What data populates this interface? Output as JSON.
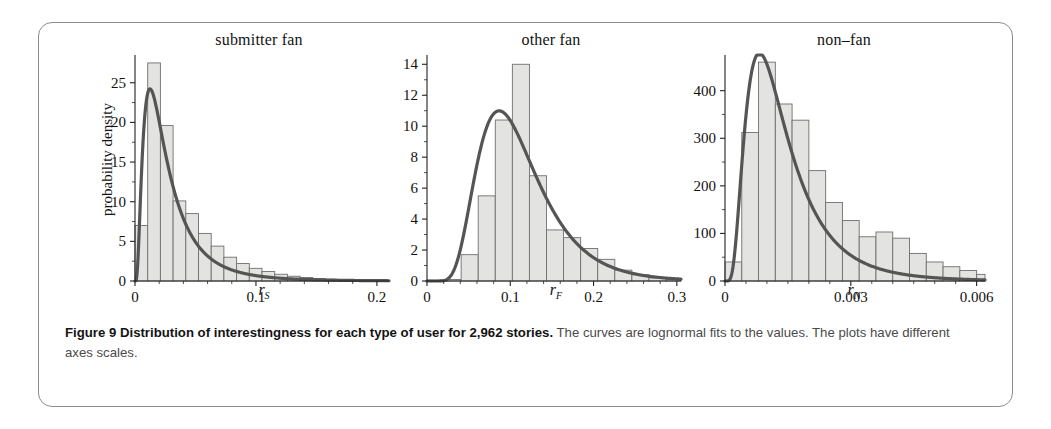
{
  "figure": {
    "caption_bold": "Figure 9  Distribution of interestingness for each type of user for 2,962 stories.",
    "caption_rest": " The curves are lognormal fits to the values. The plots have different axes scales.",
    "border_color": "#8c8c8c",
    "bar_fill": "#e3e3e1",
    "bar_stroke": "#6f6f6f",
    "curve_color": "#555555",
    "axis_color": "#222222"
  },
  "chart_data": [
    {
      "type": "bar",
      "title": "submitter fan",
      "xlabel": "rS",
      "xlabel_base": "r",
      "xlabel_sub": "S",
      "ylabel": "probability density",
      "xlim": [
        0,
        0.21
      ],
      "ylim": [
        0,
        28.5
      ],
      "xticks": [
        0,
        0.1,
        0.2
      ],
      "xticklabels": [
        "0",
        "0.1",
        "0.2"
      ],
      "xminorticks": [
        0.02,
        0.04,
        0.06,
        0.08,
        0.12,
        0.14,
        0.16,
        0.18
      ],
      "yticks": [
        0,
        5,
        10,
        15,
        20,
        25
      ],
      "yticklabels": [
        "0",
        "5",
        "10",
        "15",
        "20",
        "25"
      ],
      "bin_width": 0.0105,
      "bin_start": 0.0,
      "values": [
        7.0,
        27.5,
        19.6,
        10.1,
        8.5,
        6.0,
        4.4,
        3.0,
        2.2,
        1.6,
        1.2,
        0.85,
        0.6,
        0.45,
        0.32,
        0.22,
        0.16,
        0.12,
        0.08,
        0.05
      ],
      "fit": {
        "kind": "lognormal",
        "mu": -3.78,
        "sigma": 0.78,
        "peak_y": 22.0,
        "peak_x": 0.0175
      },
      "grid": false,
      "legend": "none"
    },
    {
      "type": "bar",
      "title": "other fan",
      "xlabel": "rF",
      "xlabel_base": "r",
      "xlabel_sub": "F",
      "ylabel": "",
      "xlim": [
        0,
        0.305
      ],
      "ylim": [
        0,
        14.6
      ],
      "xticks": [
        0,
        0.1,
        0.2,
        0.3
      ],
      "xticklabels": [
        "0",
        "0.1",
        "0.2",
        "0.3"
      ],
      "xminorticks": [
        0.02,
        0.04,
        0.06,
        0.08,
        0.12,
        0.14,
        0.16,
        0.18,
        0.22,
        0.24,
        0.26,
        0.28
      ],
      "yticks": [
        0,
        2,
        4,
        6,
        8,
        10,
        12,
        14
      ],
      "yticklabels": [
        "0",
        "2",
        "4",
        "6",
        "8",
        "10",
        "12",
        "14"
      ],
      "bin_width": 0.0205,
      "bin_start": 0.0,
      "values": [
        0.05,
        0.1,
        1.7,
        5.5,
        10.4,
        14.0,
        6.8,
        3.3,
        2.8,
        2.1,
        1.4,
        0.7,
        0.4,
        0.2,
        0.1
      ],
      "fit": {
        "kind": "lognormal",
        "mu": -2.27,
        "sigma": 0.42,
        "peak_y": 10.6,
        "peak_x": 0.097
      },
      "grid": false,
      "legend": "none"
    },
    {
      "type": "bar",
      "title": "non–fan",
      "xlabel": "rN",
      "xlabel_base": "r",
      "xlabel_sub": "N",
      "ylabel": "",
      "xlim": [
        0,
        0.0062
      ],
      "ylim": [
        0,
        475
      ],
      "xticks": [
        0,
        0.003,
        0.006
      ],
      "xticklabels": [
        "0",
        "0.003",
        "0.006"
      ],
      "xminorticks": [
        0.0005,
        0.001,
        0.0015,
        0.002,
        0.0025,
        0.0035,
        0.004,
        0.0045,
        0.005,
        0.0055
      ],
      "yticks": [
        0,
        100,
        200,
        300,
        400
      ],
      "yticklabels": [
        "0",
        "100",
        "200",
        "300",
        "400"
      ],
      "bin_width": 0.0004,
      "bin_start": 0.0,
      "values": [
        40,
        312,
        460,
        372,
        338,
        232,
        165,
        127,
        93,
        103,
        90,
        58,
        40,
        30,
        22,
        14
      ],
      "fit": {
        "kind": "lognormal",
        "mu": -6.72,
        "sigma": 0.62,
        "peak_y": 462,
        "peak_x": 0.00097
      },
      "grid": false,
      "legend": "none"
    }
  ]
}
